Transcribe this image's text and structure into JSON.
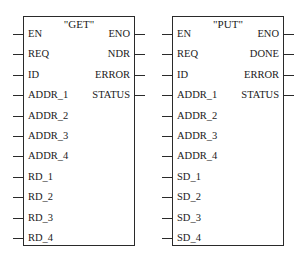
{
  "blocks": [
    {
      "title": "\"GET\"",
      "inputs": [
        "EN",
        "REQ",
        "ID",
        "ADDR_1",
        "ADDR_2",
        "ADDR_3",
        "ADDR_4",
        "RD_1",
        "RD_2",
        "RD_3",
        "RD_4"
      ],
      "outputs": [
        "ENO",
        "NDR",
        "ERROR",
        "STATUS"
      ]
    },
    {
      "title": "\"PUT\"",
      "inputs": [
        "EN",
        "REQ",
        "ID",
        "ADDR_1",
        "ADDR_2",
        "ADDR_3",
        "ADDR_4",
        "SD_1",
        "SD_2",
        "SD_3",
        "SD_4"
      ],
      "outputs": [
        "ENO",
        "DONE",
        "ERROR",
        "STATUS"
      ]
    }
  ]
}
